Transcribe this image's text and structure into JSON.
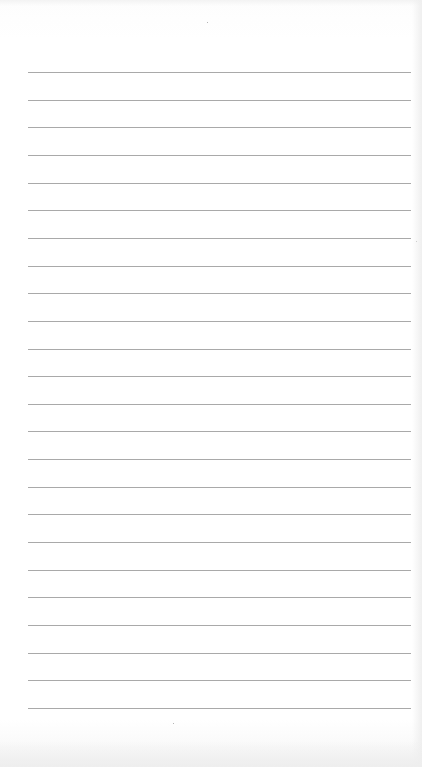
{
  "page": {
    "type": "lined-paper",
    "background_color": "#ffffff",
    "line_color": "#9a9a9a",
    "line_count": 24,
    "first_line_y": 72,
    "line_spacing": 27.65,
    "line_left": 28,
    "line_width": 383
  }
}
